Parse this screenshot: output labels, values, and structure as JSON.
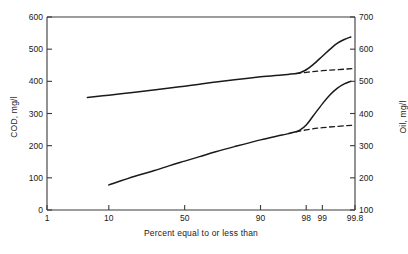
{
  "chart_data": {
    "type": "line",
    "title": "",
    "subtitle": "",
    "xlabel": "Percent equal to or less than",
    "ylabel": "COD, mg/l",
    "y2label": "Oil, mg/l",
    "xscale": "probability",
    "xlim": [
      1,
      99.8
    ],
    "xticks": [
      1,
      10,
      50,
      90,
      98,
      99,
      99.8
    ],
    "xticklabels": [
      "1",
      "10",
      "50",
      "90",
      "98",
      "99",
      "99.8"
    ],
    "ylim": [
      0,
      600
    ],
    "yticks": [
      0,
      100,
      200,
      300,
      400,
      500,
      600
    ],
    "yticklabels": [
      "0",
      "100",
      "200",
      "300",
      "400",
      "500",
      "600"
    ],
    "y2lim": [
      100,
      700
    ],
    "y2ticks": [
      100,
      200,
      300,
      400,
      500,
      600,
      700
    ],
    "y2ticklabels": [
      "100",
      "200",
      "300",
      "400",
      "500",
      "600",
      "700"
    ],
    "grid": false,
    "legend": "none",
    "series": [
      {
        "name": "COD",
        "axis": "left",
        "units": "mg/l",
        "style": "solid",
        "x": [
          5,
          10,
          20,
          30,
          40,
          50,
          60,
          70,
          80,
          90,
          95,
          97,
          97.5,
          98,
          98.5,
          99,
          99.3,
          99.5,
          99.65,
          99.75
        ],
        "y": [
          350,
          357,
          366,
          373,
          379,
          385,
          391,
          398,
          405,
          414,
          420,
          424,
          428,
          436,
          452,
          478,
          500,
          518,
          530,
          538
        ]
      },
      {
        "name": "COD extrapolation",
        "axis": "left",
        "units": "mg/l",
        "style": "dashed",
        "x": [
          97,
          98,
          99,
          99.8
        ],
        "y": [
          424,
          428,
          433,
          440
        ]
      },
      {
        "name": "Oil",
        "axis": "right",
        "units": "mg/l",
        "style": "solid",
        "x": [
          10,
          20,
          30,
          40,
          50,
          60,
          70,
          80,
          90,
          95,
          97,
          97.5,
          98,
          98.5,
          99,
          99.3,
          99.5,
          99.65,
          99.75
        ],
        "y": [
          178,
          205,
          222,
          238,
          252,
          266,
          281,
          297,
          318,
          333,
          343,
          350,
          364,
          392,
          430,
          458,
          478,
          492,
          500
        ]
      },
      {
        "name": "Oil extrapolation",
        "axis": "right",
        "units": "mg/l",
        "style": "dashed",
        "x": [
          97,
          98,
          99,
          99.8
        ],
        "y": [
          343,
          349,
          356,
          364
        ]
      }
    ],
    "annotations": [
      {
        "text": "Upper curve read on left COD axis; lower curve read on right Oil axis."
      }
    ]
  },
  "axes": {
    "left": {
      "label": "COD, mg/l",
      "ticks": [
        "600",
        "500",
        "400",
        "300",
        "200",
        "100",
        "0"
      ]
    },
    "right": {
      "label": "Oil, mg/l",
      "ticks": [
        "700",
        "600",
        "500",
        "400",
        "300",
        "200",
        "100"
      ]
    },
    "bottom": {
      "label": "Percent equal to or less than",
      "ticks": [
        "1",
        "10",
        "50",
        "90",
        "98",
        "99",
        "99.8"
      ]
    }
  },
  "style": {
    "line_color": "#1a1a1a",
    "axis_color": "#3a3a3a",
    "background": "#ffffff"
  }
}
